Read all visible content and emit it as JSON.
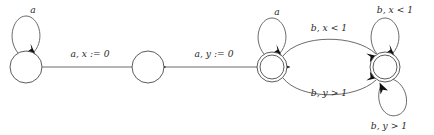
{
  "diagram": {
    "type": "state-machine",
    "colors": {
      "background": "#ffffff",
      "state_stroke": "#4a4a4a",
      "edge_stroke": "#5a5a5a",
      "arrow_fill": "#111111",
      "label_text": "#2a2a2a"
    },
    "states": [
      {
        "id": "q0",
        "label": "",
        "shape": "circle",
        "accepting": false,
        "cx": 26,
        "cy": 67,
        "r": 16
      },
      {
        "id": "q1",
        "label": "",
        "shape": "circle",
        "accepting": false,
        "cx": 148,
        "cy": 67,
        "r": 16
      },
      {
        "id": "q2",
        "label": "",
        "shape": "double-circle",
        "accepting": true,
        "cx": 272,
        "cy": 67,
        "r": 15
      },
      {
        "id": "q3",
        "label": "",
        "shape": "double-circle",
        "accepting": true,
        "cx": 385,
        "cy": 67,
        "r": 15
      }
    ],
    "transitions": [
      {
        "id": "t0",
        "from": "q0",
        "to": "q0",
        "label": "a",
        "kind": "self-loop-top"
      },
      {
        "id": "t1",
        "from": "q0",
        "to": "q1",
        "label": "a, x := 0",
        "kind": "straight"
      },
      {
        "id": "t2",
        "from": "q1",
        "to": "q2",
        "label": "a, y := 0",
        "kind": "straight"
      },
      {
        "id": "t3",
        "from": "q2",
        "to": "q2",
        "label": "a",
        "kind": "self-loop-top"
      },
      {
        "id": "t4",
        "from": "q2",
        "to": "q3",
        "label": "b, x < 1",
        "kind": "curve-upper"
      },
      {
        "id": "t5",
        "from": "q2",
        "to": "q3",
        "label": "b, y > 1",
        "kind": "curve-lower"
      },
      {
        "id": "t6",
        "from": "q3",
        "to": "q3",
        "label": "b, x < 1",
        "kind": "self-loop-top"
      },
      {
        "id": "t7",
        "from": "q3",
        "to": "q3",
        "label": "b, y > 1",
        "kind": "self-loop-bottom"
      }
    ],
    "labels": {
      "loop_q0": "a",
      "edge_q0_q1": "a, x := 0",
      "edge_q1_q2": "a, y := 0",
      "loop_q2": "a",
      "curve_upper": "b, x < 1",
      "curve_lower": "b, y > 1",
      "loop_q3_top": "b, x < 1",
      "loop_q3_bottom": "b, y > 1"
    }
  }
}
